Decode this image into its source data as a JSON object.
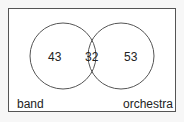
{
  "venn": {
    "set_a": "band",
    "set_b": "orchestra",
    "only_a": "43",
    "both": "32",
    "only_b": "53"
  },
  "colors": {
    "stroke": "#555555",
    "background": "#f7f7f7",
    "inner": "#ffffff"
  }
}
